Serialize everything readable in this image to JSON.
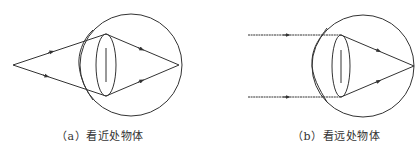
{
  "figure": {
    "panels": [
      {
        "id": "a",
        "caption": "（a）看近处物体",
        "ray_type": "diverging",
        "description": "Rays from a near point source diverge, pass through the thickened lens, and converge to a focus on the retina"
      },
      {
        "id": "b",
        "caption": "（b）看远处物体",
        "ray_type": "parallel",
        "description": "Parallel rays from a distant object pass through the thinner lens and converge to a focus on the retina"
      }
    ],
    "colors": {
      "stroke": "#333333",
      "background": "#ffffff"
    }
  }
}
